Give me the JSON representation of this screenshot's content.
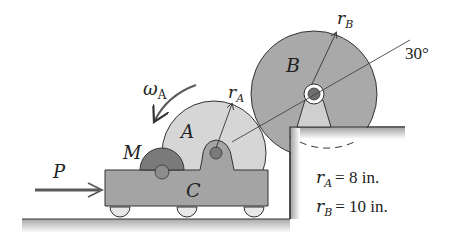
{
  "figure": {
    "labels": {
      "omega_a": "ω",
      "omega_a_sub": "A",
      "gear_a": "A",
      "gear_b": "B",
      "motor": "M",
      "cart": "C",
      "force": "P",
      "r_a": "r",
      "r_a_sub": "A",
      "r_b": "r",
      "r_b_sub": "B",
      "angle": "30°"
    },
    "given": {
      "r_a": {
        "symbol": "r",
        "sub": "A",
        "value": "= 8 in."
      },
      "r_b": {
        "symbol": "r",
        "sub": "B",
        "value": "= 10 in."
      }
    },
    "colors": {
      "gear_a_fill": "#d6d6d6",
      "gear_b_fill": "#a9a9a9",
      "cart_fill": "#a4a4a4",
      "motor_fill": "#7a7a7a",
      "ground_fill": "#b9b9b9",
      "outline": "#333333",
      "arrow": "#5a5a5a"
    }
  }
}
